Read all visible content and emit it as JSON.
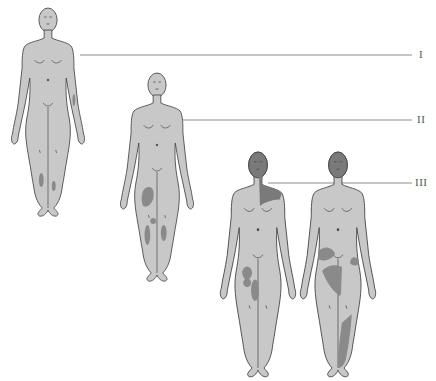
{
  "figure": {
    "type": "anatomical-stage-diagram",
    "stages": [
      {
        "id": "I",
        "label": "I"
      },
      {
        "id": "II",
        "label": "II"
      },
      {
        "id": "III",
        "label": "III"
      }
    ]
  },
  "colors": {
    "skin": "#c8c8c8",
    "outline": "#4a4a4a",
    "lesion": "#8a8a8a",
    "head_affected": "#7a7a7a",
    "leader_line": "#8c8c8c",
    "label": "#555555"
  }
}
